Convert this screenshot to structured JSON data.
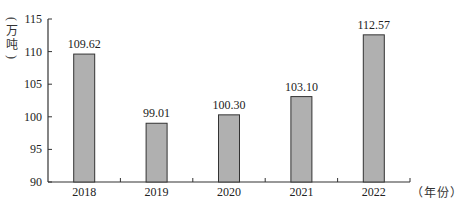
{
  "chart_data": {
    "type": "bar",
    "title": "",
    "xlabel": "（年份）",
    "ylabel": "（万吨）",
    "categories": [
      "2018",
      "2019",
      "2020",
      "2021",
      "2022"
    ],
    "values": [
      109.62,
      99.01,
      100.3,
      103.1,
      112.57
    ],
    "value_labels": [
      "109.62",
      "99.01",
      "100.30",
      "103.10",
      "112.57"
    ],
    "ylim": [
      90,
      115
    ],
    "yticks": [
      90,
      95,
      100,
      105,
      110,
      115
    ],
    "grid": false,
    "legend": null,
    "bar_color": "#b0b0b0",
    "bar_edge_color": "#333333"
  },
  "axis": {
    "y_unit_chars": [
      "万",
      "吨"
    ],
    "x_unit": "（年份）"
  }
}
